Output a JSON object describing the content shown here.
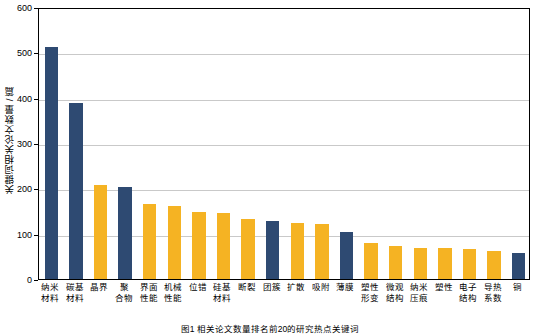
{
  "chart_data": {
    "type": "bar",
    "title": "",
    "caption": "图1 相关论文数量排名前20的研究热点关键词",
    "xlabel": "",
    "ylabel": "关键词相关论文数量 / 篇",
    "ylim": [
      0,
      600
    ],
    "yticks": [
      0,
      100,
      200,
      300,
      400,
      500,
      600
    ],
    "grid": true,
    "legend": false,
    "categories": [
      "纳米\n材料",
      "碳基\n材料",
      "晶界",
      "聚\n合物",
      "界面\n性能",
      "机械\n性能",
      "位错",
      "硅基\n材料",
      "断裂",
      "团簇",
      "扩散",
      "吸附",
      "薄膜",
      "塑性\n形变",
      "微观\n结构",
      "纳米\n压痕",
      "塑性",
      "电子\n结构",
      "导热\n系数",
      "铜"
    ],
    "values": [
      512,
      388,
      207,
      203,
      166,
      162,
      148,
      145,
      133,
      129,
      124,
      121,
      104,
      80,
      72,
      69,
      68,
      67,
      61,
      58
    ],
    "bar_colors": [
      "#2e4a72",
      "#2e4a72",
      "#f5b323",
      "#2e4a72",
      "#f5b323",
      "#f5b323",
      "#f5b323",
      "#f5b323",
      "#f5b323",
      "#2e4a72",
      "#f5b323",
      "#f5b323",
      "#2e4a72",
      "#f5b323",
      "#f5b323",
      "#f5b323",
      "#f5b323",
      "#f5b323",
      "#f5b323",
      "#2e4a72"
    ],
    "colors": {
      "blue": "#2e4a72",
      "yellow": "#f5b323",
      "grid": "#c9c9c9",
      "axis": "#000000",
      "background": "#ffffff"
    }
  }
}
